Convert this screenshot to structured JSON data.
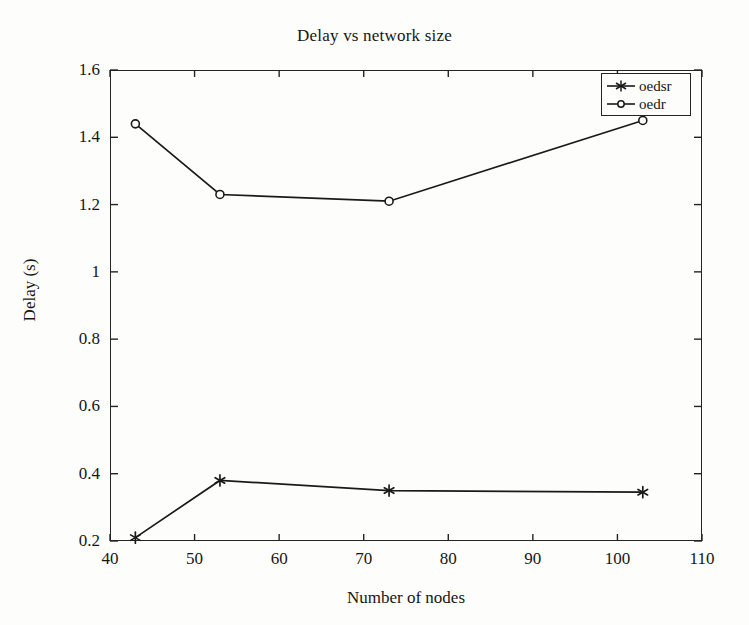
{
  "chart_data": {
    "type": "line",
    "title": "Delay vs network size",
    "xlabel": "Number of nodes",
    "ylabel": "Delay (s)",
    "xlim": [
      40,
      110
    ],
    "ylim": [
      0.2,
      1.6
    ],
    "xticks": [
      40,
      50,
      60,
      70,
      80,
      90,
      100,
      110
    ],
    "xtick_labels": [
      "40",
      "50",
      "60",
      "70",
      "80",
      "90",
      "100",
      "110"
    ],
    "yticks": [
      0.2,
      0.4,
      0.6,
      0.8,
      1.0,
      1.2,
      1.4,
      1.6
    ],
    "ytick_labels": [
      "0.2",
      "0.4",
      "0.6",
      "0.8",
      "1",
      "1.2",
      "1.4",
      "1.6"
    ],
    "grid": false,
    "legend_position": "upper right",
    "line_color": "#1a1a1a",
    "background_color": "#fdfdfb",
    "x": [
      43,
      53,
      73,
      103
    ],
    "series": [
      {
        "name": "oedsr",
        "marker": "star",
        "x": [
          43,
          53,
          73,
          103
        ],
        "values": [
          0.21,
          0.38,
          0.35,
          0.345
        ]
      },
      {
        "name": "oedr",
        "marker": "circle",
        "x": [
          43,
          53,
          73,
          103
        ],
        "values": [
          1.44,
          1.23,
          1.21,
          1.45
        ]
      }
    ]
  },
  "legend": {
    "entries": [
      {
        "label": "oedsr",
        "marker": "star-marker-icon"
      },
      {
        "label": "oedr",
        "marker": "circle-marker-icon"
      }
    ]
  }
}
